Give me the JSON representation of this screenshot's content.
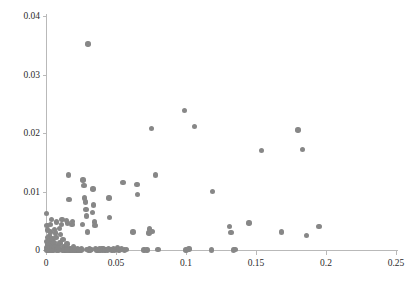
{
  "chart_data": {
    "type": "scatter",
    "title": "",
    "xlabel": "",
    "ylabel": "",
    "xlim": [
      0,
      0.25
    ],
    "ylim": [
      0,
      0.04
    ],
    "grid": false,
    "legend": null,
    "marker": {
      "shape": "circle",
      "color": "#878787",
      "size_px": 5.4
    },
    "axis_color": "#b9b9b9",
    "tick_label_color": "#2b2b2b",
    "xticks": [
      0,
      0.05,
      0.1,
      0.15,
      0.2,
      0.25
    ],
    "xtick_labels": [
      "0",
      "0.05",
      "0.1",
      "0.15",
      "0.2",
      "0.25"
    ],
    "yticks": [
      0,
      0.01,
      0.02,
      0.03,
      0.04
    ],
    "ytick_labels": [
      "0",
      "0.01",
      "0.02",
      "0.03",
      "0.04"
    ],
    "points": [
      [
        0.0005,
        0.0062
      ],
      [
        0.0008,
        0.0042
      ],
      [
        0.001,
        0.0034
      ],
      [
        0.0012,
        0.0021
      ],
      [
        0.0006,
        0.0015
      ],
      [
        0.0009,
        0.001
      ],
      [
        0.0013,
        0.0007
      ],
      [
        0.0004,
        0.0004
      ],
      [
        0.0011,
        0.0002
      ],
      [
        0.0016,
        0.0001
      ],
      [
        0.0007,
        0.0
      ],
      [
        0.0015,
        0.0
      ],
      [
        0.002,
        0.0
      ],
      [
        0.0024,
        0.0
      ],
      [
        0.0018,
        0.0003
      ],
      [
        0.0028,
        0.0006
      ],
      [
        0.0022,
        0.0011
      ],
      [
        0.003,
        0.0016
      ],
      [
        0.0026,
        0.0024
      ],
      [
        0.0034,
        0.0031
      ],
      [
        0.0032,
        0.0044
      ],
      [
        0.0038,
        0.0052
      ],
      [
        0.0042,
        0.0019
      ],
      [
        0.0046,
        0.0009
      ],
      [
        0.004,
        0.0004
      ],
      [
        0.005,
        0.0001
      ],
      [
        0.0044,
        0.0
      ],
      [
        0.0055,
        0.0
      ],
      [
        0.006,
        0.0002
      ],
      [
        0.0065,
        0.0006
      ],
      [
        0.0058,
        0.0013
      ],
      [
        0.007,
        0.0021
      ],
      [
        0.0062,
        0.0035
      ],
      [
        0.0075,
        0.0048
      ],
      [
        0.0068,
        0.0029
      ],
      [
        0.008,
        0.0008
      ],
      [
        0.0085,
        0.0003
      ],
      [
        0.0078,
        0.0
      ],
      [
        0.009,
        0.0
      ],
      [
        0.0095,
        0.0001
      ],
      [
        0.0088,
        0.0005
      ],
      [
        0.01,
        0.0012
      ],
      [
        0.0105,
        0.0027
      ],
      [
        0.011,
        0.0044
      ],
      [
        0.0098,
        0.0037
      ],
      [
        0.0115,
        0.0052
      ],
      [
        0.012,
        0.0018
      ],
      [
        0.0125,
        0.0006
      ],
      [
        0.013,
        0.0002
      ],
      [
        0.0118,
        0.0
      ],
      [
        0.0135,
        0.0
      ],
      [
        0.014,
        0.0001
      ],
      [
        0.0145,
        0.0004
      ],
      [
        0.015,
        0.001
      ],
      [
        0.0155,
        0.0046
      ],
      [
        0.0148,
        0.005
      ],
      [
        0.016,
        0.0128
      ],
      [
        0.0165,
        0.0086
      ],
      [
        0.017,
        0.0003
      ],
      [
        0.0175,
        0.0
      ],
      [
        0.018,
        0.0001
      ],
      [
        0.0185,
        0.0044
      ],
      [
        0.019,
        0.0049
      ],
      [
        0.0195,
        0.0006
      ],
      [
        0.02,
        0.0
      ],
      [
        0.0205,
        0.0002
      ],
      [
        0.021,
        0.0
      ],
      [
        0.0215,
        0.0001
      ],
      [
        0.022,
        0.0
      ],
      [
        0.0225,
        0.0003
      ],
      [
        0.023,
        0.0
      ],
      [
        0.024,
        0.0001
      ],
      [
        0.025,
        0.0
      ],
      [
        0.0255,
        0.0002
      ],
      [
        0.026,
        0.0044
      ],
      [
        0.0265,
        0.012
      ],
      [
        0.027,
        0.011
      ],
      [
        0.0275,
        0.0089
      ],
      [
        0.028,
        0.0082
      ],
      [
        0.0285,
        0.0069
      ],
      [
        0.029,
        0.0058
      ],
      [
        0.0295,
        0.0031
      ],
      [
        0.03,
        0.0352
      ],
      [
        0.0305,
        0.0
      ],
      [
        0.031,
        0.0002
      ],
      [
        0.0315,
        0.0
      ],
      [
        0.032,
        0.0001
      ],
      [
        0.033,
        0.0064
      ],
      [
        0.0335,
        0.0104
      ],
      [
        0.034,
        0.0077
      ],
      [
        0.0345,
        0.0048
      ],
      [
        0.035,
        0.0042
      ],
      [
        0.0355,
        0.0003
      ],
      [
        0.036,
        0.0
      ],
      [
        0.0365,
        0.0001
      ],
      [
        0.037,
        0.0
      ],
      [
        0.038,
        0.0002
      ],
      [
        0.0385,
        0.0
      ],
      [
        0.039,
        0.0001
      ],
      [
        0.04,
        0.0003
      ],
      [
        0.0405,
        0.0
      ],
      [
        0.041,
        0.0002
      ],
      [
        0.042,
        0.0
      ],
      [
        0.043,
        0.0001
      ],
      [
        0.044,
        0.0
      ],
      [
        0.0445,
        0.0003
      ],
      [
        0.045,
        0.0089
      ],
      [
        0.0455,
        0.0056
      ],
      [
        0.046,
        0.0001
      ],
      [
        0.047,
        0.0
      ],
      [
        0.048,
        0.0002
      ],
      [
        0.049,
        0.0
      ],
      [
        0.05,
        0.0001
      ],
      [
        0.051,
        0.0004
      ],
      [
        0.052,
        0.0
      ],
      [
        0.053,
        0.0001
      ],
      [
        0.029,
        0.0001
      ],
      [
        0.0235,
        0.0
      ],
      [
        0.0165,
        0.0
      ],
      [
        0.0128,
        0.0
      ],
      [
        0.015,
        0.0
      ],
      [
        0.0185,
        0.0
      ],
      [
        0.0205,
        0.0001
      ],
      [
        0.054,
        0.0002
      ],
      [
        0.055,
        0.0115
      ],
      [
        0.056,
        0.0
      ],
      [
        0.0575,
        0.0001
      ],
      [
        0.062,
        0.0031
      ],
      [
        0.065,
        0.0112
      ],
      [
        0.0655,
        0.0095
      ],
      [
        0.07,
        0.0
      ],
      [
        0.072,
        0.0
      ],
      [
        0.0735,
        0.0029
      ],
      [
        0.074,
        0.0036
      ],
      [
        0.0755,
        0.0208
      ],
      [
        0.076,
        0.0032
      ],
      [
        0.078,
        0.0128
      ],
      [
        0.08,
        0.0001
      ],
      [
        0.099,
        0.0238
      ],
      [
        0.1,
        0.0
      ],
      [
        0.101,
        0.0001
      ],
      [
        0.102,
        0.0002
      ],
      [
        0.106,
        0.0211
      ],
      [
        0.118,
        0.0
      ],
      [
        0.119,
        0.01
      ],
      [
        0.131,
        0.004
      ],
      [
        0.132,
        0.003
      ],
      [
        0.135,
        0.0001
      ],
      [
        0.145,
        0.0046
      ],
      [
        0.154,
        0.017
      ],
      [
        0.168,
        0.0031
      ],
      [
        0.18,
        0.0205
      ],
      [
        0.183,
        0.0172
      ],
      [
        0.186,
        0.0025
      ],
      [
        0.195,
        0.004
      ],
      [
        0.134,
        0.0
      ]
    ]
  }
}
